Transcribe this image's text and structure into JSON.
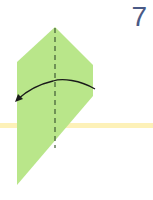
{
  "step": {
    "number": "7"
  },
  "colors": {
    "paper": "#b9e68a",
    "guide_band": "#fdf0b0",
    "fold_line": "#3f5a35",
    "arrow": "#1a1a1a",
    "step_number": "#4a5a86"
  },
  "diagram": {
    "paper_shape": "hexagon-kite",
    "fold_line": "valley-fold-vertical-dashed",
    "arrow": "curved-fold-arrow-right-to-left"
  }
}
